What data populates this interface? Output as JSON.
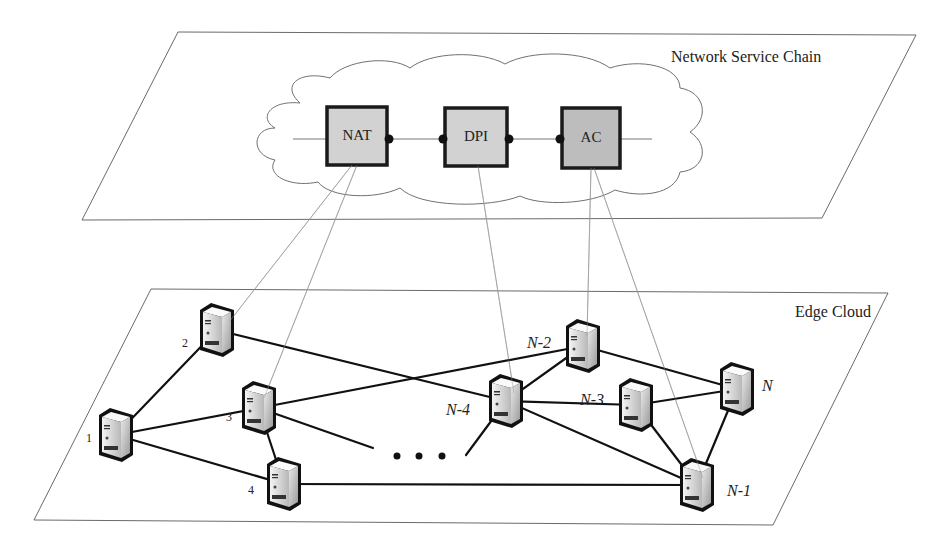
{
  "diagram": {
    "upper_plane": {
      "label": "Network Service Chain",
      "corners": [
        [
          178,
          32
        ],
        [
          916,
          35
        ],
        [
          822,
          218
        ],
        [
          82,
          220
        ]
      ]
    },
    "lower_plane": {
      "label": "Edge Cloud",
      "corners": [
        [
          151,
          289
        ],
        [
          888,
          293
        ],
        [
          773,
          525
        ],
        [
          34,
          520
        ]
      ]
    },
    "service_chain": {
      "vnfs": [
        {
          "id": "nat",
          "label": "NAT",
          "x": 327,
          "y": 107,
          "w": 60,
          "h": 58,
          "fill": "#d2d2d2"
        },
        {
          "id": "dpi",
          "label": "DPI",
          "x": 445,
          "y": 108,
          "w": 62,
          "h": 58,
          "fill": "#d2d2d2"
        },
        {
          "id": "ac",
          "label": "AC",
          "x": 562,
          "y": 108,
          "w": 58,
          "h": 60,
          "fill": "#bdbdbd"
        }
      ],
      "chain_line": {
        "y": 139,
        "x_start": 293,
        "x_end": 652
      }
    },
    "nodes": [
      {
        "id": "1",
        "label": "1",
        "italic": false,
        "cx": 116,
        "cy": 435,
        "lx": 86,
        "ly": 442
      },
      {
        "id": "2",
        "label": "2",
        "italic": false,
        "cx": 217,
        "cy": 330,
        "lx": 182,
        "ly": 347
      },
      {
        "id": "3",
        "label": "3",
        "italic": false,
        "cx": 259,
        "cy": 408,
        "lx": 226,
        "ly": 421
      },
      {
        "id": "4",
        "label": "4",
        "italic": false,
        "cx": 284,
        "cy": 484,
        "lx": 248,
        "ly": 494
      },
      {
        "id": "N-4",
        "label": "N-4",
        "italic": true,
        "cx": 506,
        "cy": 401,
        "lx": 446,
        "ly": 415
      },
      {
        "id": "N-2",
        "label": "N-2",
        "italic": true,
        "cx": 583,
        "cy": 346,
        "lx": 527,
        "ly": 348
      },
      {
        "id": "N-3",
        "label": "N-3",
        "italic": true,
        "cx": 636,
        "cy": 405,
        "lx": 580,
        "ly": 405
      },
      {
        "id": "N",
        "label": "N",
        "italic": true,
        "cx": 737,
        "cy": 389,
        "lx": 762,
        "ly": 391
      },
      {
        "id": "N-1",
        "label": "N-1",
        "italic": true,
        "cx": 697,
        "cy": 485,
        "lx": 727,
        "ly": 496
      }
    ],
    "edges": [
      [
        "1",
        "2"
      ],
      [
        "1",
        "3"
      ],
      [
        "1",
        "4"
      ],
      [
        "3",
        "4"
      ],
      [
        "2",
        "N-4"
      ],
      [
        "3",
        "N-2"
      ],
      [
        "4",
        "N-1"
      ],
      [
        "N-4",
        "N-2"
      ],
      [
        "N-4",
        "N-3"
      ],
      [
        "N-4",
        "N-1"
      ],
      [
        "N-2",
        "N"
      ],
      [
        "N-3",
        "N"
      ],
      [
        "N-3",
        "N-1"
      ],
      [
        "N",
        "N-1"
      ]
    ],
    "dangling_edges": [
      {
        "from": "3",
        "to": [
          373,
          448
        ]
      },
      {
        "from": "N-4",
        "to": [
          466,
          455
        ]
      }
    ],
    "ellipsis": {
      "dots": [
        [
          397,
          456
        ],
        [
          419,
          456
        ],
        [
          442,
          456
        ]
      ],
      "symbol": "• • •"
    },
    "mappings": [
      {
        "vnf": "nat",
        "from": [
          352,
          165
        ],
        "to": [
          229,
          322
        ]
      },
      {
        "vnf": "nat",
        "from": [
          357,
          165
        ],
        "to": [
          264,
          398
        ]
      },
      {
        "vnf": "dpi",
        "from": [
          478,
          166
        ],
        "to": [
          514,
          393
        ]
      },
      {
        "vnf": "ac",
        "from": [
          591,
          168
        ],
        "to": [
          587,
          336
        ]
      },
      {
        "vnf": "ac",
        "from": [
          594,
          168
        ],
        "to": [
          703,
          478
        ]
      }
    ]
  }
}
